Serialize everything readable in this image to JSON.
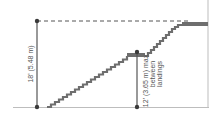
{
  "diagram": {
    "type": "stair-landing-elevation",
    "colors": {
      "stair": "#6e6e6e",
      "line": "#555555",
      "ground": "#bdbdbd",
      "dot": "#3a3a3a",
      "dash": "#555555"
    },
    "labels": {
      "total_height": "18' (5.48 m)",
      "max_between_line1": "12' (3.65 m) max.",
      "max_between_line2": "between",
      "max_between_line3": "landings"
    }
  }
}
